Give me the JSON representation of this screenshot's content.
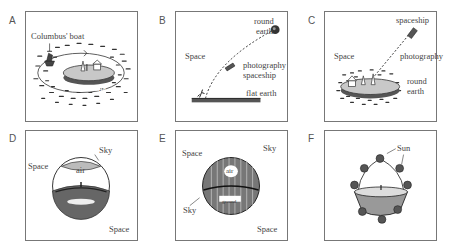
{
  "figure": {
    "panels": [
      {
        "id": "A",
        "labels": {
          "boat": "Columbus' boat",
          "earth": "round earth"
        }
      },
      {
        "id": "B",
        "labels": {
          "round1": "round",
          "round2": "earth",
          "space": "Space",
          "photo": "photography",
          "ship": "spaceship",
          "flat": "flat earth"
        }
      },
      {
        "id": "C",
        "labels": {
          "ship": "spaceship",
          "space": "Space",
          "photo": "photography",
          "round1": "round",
          "round2": "earth"
        }
      },
      {
        "id": "D",
        "labels": {
          "sky": "Sky",
          "space1": "Space",
          "air": "air",
          "space2": "Space"
        }
      },
      {
        "id": "E",
        "labels": {
          "space1": "Space",
          "sky1": "Sky",
          "air": "air",
          "sky2": "Sky",
          "ground": "ground",
          "space2": "Space"
        }
      },
      {
        "id": "F",
        "labels": {
          "sun": "Sun"
        }
      }
    ]
  },
  "colors": {
    "ink": "#2a2a2a",
    "border": "#777777",
    "text": "#444444"
  }
}
